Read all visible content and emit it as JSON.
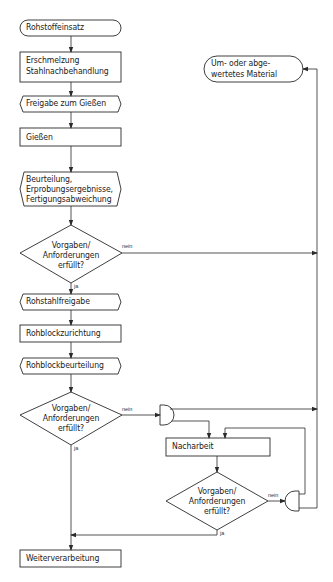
{
  "diagram": {
    "type": "flowchart",
    "colors": {
      "stroke": "#2a2a2a",
      "background": "#ffffff",
      "text": "#222222"
    },
    "nodes": [
      {
        "id": "n1",
        "shape": "terminator",
        "label": "Rohstoffeinsatz"
      },
      {
        "id": "n2",
        "shape": "process",
        "lines": [
          "Erschmelzung",
          "Stahlnachbehandlung"
        ]
      },
      {
        "id": "n3",
        "shape": "preparation",
        "label": "Freigabe zum Gießen"
      },
      {
        "id": "n4",
        "shape": "process",
        "label": "Gießen"
      },
      {
        "id": "n5",
        "shape": "preparation",
        "lines": [
          "Beurteilung,",
          "Erprobungsergebnisse,",
          "Fertigungsabweichung"
        ]
      },
      {
        "id": "d1",
        "shape": "decision",
        "lines": [
          "Vorgaben/",
          "Anforderungen",
          "erfüllt?"
        ]
      },
      {
        "id": "n6",
        "shape": "preparation",
        "label": "Rohstahlfreigabe"
      },
      {
        "id": "n7",
        "shape": "process",
        "label": "Rohblockzurichtung"
      },
      {
        "id": "n8",
        "shape": "preparation",
        "label": "Rohblockbeurteilung"
      },
      {
        "id": "d2",
        "shape": "decision",
        "lines": [
          "Vorgaben/",
          "Anforderungen",
          "erfüllt?"
        ]
      },
      {
        "id": "j1",
        "shape": "junction",
        "label": ""
      },
      {
        "id": "n9",
        "shape": "process",
        "label": "Nacharbeit"
      },
      {
        "id": "d3",
        "shape": "decision",
        "lines": [
          "Vorgaben/",
          "Anforderungen",
          "erfüllt?"
        ]
      },
      {
        "id": "j2",
        "shape": "junction",
        "label": ""
      },
      {
        "id": "n10",
        "shape": "process",
        "label": "Weiterverarbeitung"
      },
      {
        "id": "n11",
        "shape": "terminator",
        "lines": [
          "Um- oder abge-",
          "wertetes Material"
        ]
      }
    ],
    "edge_labels": {
      "yes": "ja",
      "no": "nein"
    },
    "edges": [
      {
        "from": "n1",
        "to": "n2"
      },
      {
        "from": "n2",
        "to": "n3"
      },
      {
        "from": "n3",
        "to": "n4"
      },
      {
        "from": "n4",
        "to": "n5"
      },
      {
        "from": "n5",
        "to": "d1"
      },
      {
        "from": "d1",
        "to": "n6",
        "label": "ja"
      },
      {
        "from": "d1",
        "to": "n11",
        "label": "nein"
      },
      {
        "from": "n6",
        "to": "n7"
      },
      {
        "from": "n7",
        "to": "n8"
      },
      {
        "from": "n8",
        "to": "d2"
      },
      {
        "from": "d2",
        "to": "n10",
        "label": "ja"
      },
      {
        "from": "d2",
        "to": "j1",
        "label": "nein"
      },
      {
        "from": "j1",
        "to": "n9"
      },
      {
        "from": "j1",
        "to": "n11"
      },
      {
        "from": "n9",
        "to": "d3"
      },
      {
        "from": "d3",
        "to": "n10",
        "label": "ja"
      },
      {
        "from": "d3",
        "to": "j2",
        "label": "nein"
      },
      {
        "from": "j2",
        "to": "n9"
      },
      {
        "from": "j2",
        "to": "n11"
      }
    ]
  }
}
